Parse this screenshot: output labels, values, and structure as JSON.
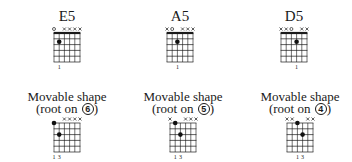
{
  "top_row": [
    {
      "name": "E5",
      "markers": [
        "o",
        "",
        "x",
        "x",
        "x",
        "x"
      ],
      "dots": [
        {
          "string": 5,
          "fret": 2
        }
      ],
      "nut": true,
      "fingering": "1",
      "fingering_string": 5
    },
    {
      "name": "A5",
      "markers": [
        "x",
        "o",
        "",
        "x",
        "x",
        "x"
      ],
      "dots": [
        {
          "string": 4,
          "fret": 2
        }
      ],
      "nut": true,
      "fingering": "1",
      "fingering_string": 4
    },
    {
      "name": "D5",
      "markers": [
        "x",
        "x",
        "o",
        "",
        "x",
        "x"
      ],
      "dots": [
        {
          "string": 3,
          "fret": 2
        }
      ],
      "nut": true,
      "fingering": "1",
      "fingering_string": 3
    }
  ],
  "bottom_row": [
    {
      "title": "Movable shape",
      "subtitle": "(root on ",
      "root": "6",
      "subtitle_end": ")",
      "markers": [
        "",
        "",
        "x",
        "x",
        "x",
        "x"
      ],
      "dots": [
        {
          "string": 6,
          "fret": 1
        },
        {
          "string": 5,
          "fret": 3
        }
      ],
      "nut": false,
      "fingering": "1 3"
    },
    {
      "title": "Movable shape",
      "subtitle": "(root on ",
      "root": "5",
      "subtitle_end": ")",
      "markers": [
        "x",
        "",
        "",
        "x",
        "x",
        "x"
      ],
      "dots": [
        {
          "string": 5,
          "fret": 1
        },
        {
          "string": 4,
          "fret": 3
        }
      ],
      "nut": false,
      "fingering": "1 3"
    },
    {
      "title": "Movable shape",
      "subtitle": "(root on ",
      "root": "4",
      "subtitle_end": ")",
      "markers": [
        "x",
        "x",
        "",
        "",
        "x",
        "x"
      ],
      "dots": [
        {
          "string": 4,
          "fret": 1
        },
        {
          "string": 3,
          "fret": 3
        }
      ],
      "nut": false,
      "fingering": "1 3"
    }
  ]
}
